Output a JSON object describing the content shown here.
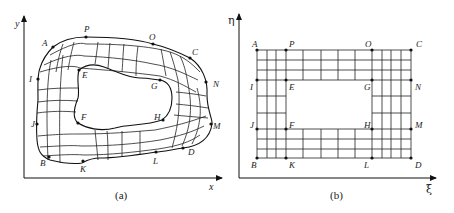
{
  "figure": {
    "panel_a": {
      "caption": "(a)",
      "x_axis_label": "x",
      "y_axis_label": "y",
      "description": "Physical domain: curvilinear structured grid around a hole",
      "points": {
        "A": "A",
        "P": "P",
        "O": "O",
        "C": "C",
        "I": "I",
        "E": "E",
        "G": "G",
        "N": "N",
        "J": "J",
        "F": "F",
        "H": "H",
        "M": "M",
        "B": "B",
        "K": "K",
        "L": "L",
        "D": "D"
      }
    },
    "panel_b": {
      "caption": "(b)",
      "x_axis_label": "ξ",
      "y_axis_label": "η",
      "description": "Computational domain: rectangular grid with rectangular hole",
      "points": {
        "A": "A",
        "P": "P",
        "O": "O",
        "C": "C",
        "I": "I",
        "E": "E",
        "G": "G",
        "N": "N",
        "J": "J",
        "F": "F",
        "H": "H",
        "M": "M",
        "B": "B",
        "K": "K",
        "L": "L",
        "D": "D"
      }
    },
    "colors": {
      "line": "#111111",
      "background": "#ffffff"
    }
  }
}
